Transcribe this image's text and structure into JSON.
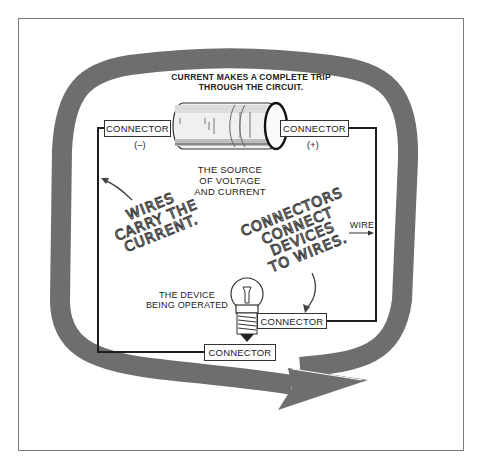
{
  "diagram": {
    "title_line1": "CURRENT MAKES A COMPLETE TRIP",
    "title_line2": "THROUGH THE CIRCUIT.",
    "source": {
      "line1": "THE SOURCE",
      "line2": "OF VOLTAGE",
      "line3": "AND CURRENT"
    },
    "connectors": {
      "top_left": "CONNECTOR",
      "top_right": "CONNECTOR",
      "device_right": "CONNECTOR",
      "bottom": "CONNECTOR"
    },
    "polarity": {
      "negative": "(–)",
      "positive": "(+)"
    },
    "wire_label": "WIRE",
    "device": {
      "line1": "THE DEVICE",
      "line2": "BEING OPERATED"
    },
    "annotations": {
      "wires": [
        "WIRES",
        "CARRY THE",
        "CURRENT."
      ],
      "connectors": [
        "CONNECTORS",
        "CONNECT",
        "DEVICES",
        "TO WIRES."
      ]
    },
    "colors": {
      "arrow": "#6e6e6e",
      "wire": "#1e1e1e",
      "frame": "#7a7a7a"
    },
    "icons": [
      "battery-icon",
      "light-bulb-icon",
      "circular-arrow-icon"
    ]
  }
}
